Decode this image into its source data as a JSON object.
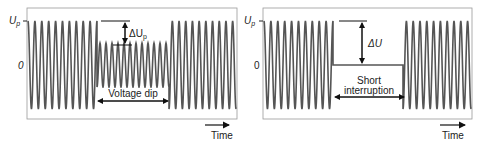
{
  "panels": [
    {
      "id": "voltage-dip",
      "y_axis_labels": {
        "peak": "U",
        "peak_sub": "p",
        "zero": "0"
      },
      "delta_label": "ΔU",
      "delta_sub": "p",
      "event_label": "Voltage dip",
      "time_label": "Time",
      "segments": [
        {
          "kind": "sine",
          "cycles": 10,
          "amplitude_rel": 1.0
        },
        {
          "kind": "sine",
          "cycles": 12,
          "amplitude_rel": 0.5
        },
        {
          "kind": "sine",
          "cycles": 10,
          "amplitude_rel": 1.0
        }
      ]
    },
    {
      "id": "short-interruption",
      "y_axis_labels": {
        "peak": "U",
        "peak_sub": "p",
        "zero": "0"
      },
      "delta_label": "ΔU",
      "delta_sub": "",
      "event_label_line1": "Short",
      "event_label_line2": "interruption",
      "time_label": "Time",
      "segments": [
        {
          "kind": "sine",
          "cycles": 10,
          "amplitude_rel": 1.0
        },
        {
          "kind": "flat",
          "value": 0
        },
        {
          "kind": "sine",
          "cycles": 10,
          "amplitude_rel": 1.0
        }
      ]
    }
  ],
  "colors": {
    "wave": "#555555",
    "frame": "#888888",
    "text": "#222222"
  }
}
